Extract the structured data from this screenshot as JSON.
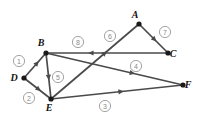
{
  "diagram": {
    "width": 199,
    "height": 122,
    "background_color": "#ffffff",
    "edge_color": "#4a4a4a",
    "vertex_color": "#1a1a1a",
    "badge_color": "#8a8a8a",
    "vertices": [
      {
        "id": "A",
        "label": "A",
        "x": 139,
        "y": 24,
        "label_dx": -4,
        "label_dy": -6
      },
      {
        "id": "B",
        "label": "B",
        "x": 46,
        "y": 53,
        "label_dx": -5,
        "label_dy": -7
      },
      {
        "id": "C",
        "label": "C",
        "x": 168,
        "y": 53,
        "label_dx": 5,
        "label_dy": 4
      },
      {
        "id": "D",
        "label": "D",
        "x": 24,
        "y": 78,
        "label_dx": -10,
        "label_dy": 3
      },
      {
        "id": "E",
        "label": "E",
        "x": 51,
        "y": 99,
        "label_dx": -2,
        "label_dy": 12
      },
      {
        "id": "F",
        "label": "F",
        "x": 183,
        "y": 85,
        "label_dx": 5,
        "label_dy": 3
      }
    ],
    "edges": [
      {
        "number": "1",
        "badge": "1",
        "from": "D",
        "to": "B",
        "badge_x": 19,
        "badge_y": 61,
        "arrow_t": 0.55
      },
      {
        "number": "2",
        "badge": "2",
        "from": "B",
        "to": "D",
        "badge_x": 29,
        "badge_y": 98,
        "arrow_t": 0.5,
        "path": "D-E"
      },
      {
        "number": "3",
        "badge": "3",
        "from": "E",
        "to": "F",
        "badge_x": 105,
        "badge_y": 106,
        "arrow_t": 0.52
      },
      {
        "number": "4",
        "badge": "4",
        "from": "B",
        "to": "F",
        "badge_x": 136,
        "badge_y": 66,
        "arrow_t": 0.62
      },
      {
        "number": "5",
        "badge": "5",
        "from": "B",
        "to": "E",
        "badge_x": 58,
        "badge_y": 77,
        "arrow_t": 0.5
      },
      {
        "number": "6",
        "badge": "6",
        "from": "E",
        "to": "A",
        "badge_x": 110,
        "badge_y": 36,
        "arrow_t": 0.6
      },
      {
        "number": "7",
        "badge": "7",
        "from": "A",
        "to": "C",
        "badge_x": 165,
        "badge_y": 32,
        "arrow_t": 0.5
      },
      {
        "number": "8",
        "badge": "8",
        "from": "C",
        "to": "B",
        "badge_x": 78,
        "badge_y": 42,
        "arrow_t": 0.62
      }
    ]
  }
}
